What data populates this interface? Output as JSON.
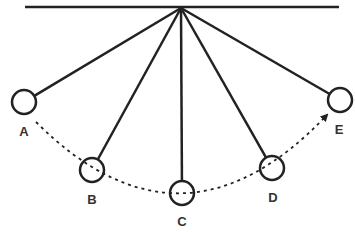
{
  "diagram": {
    "ceiling": {
      "x1": 25,
      "y1": 7,
      "x2": 339,
      "y2": 7
    },
    "pivot": {
      "x": 181,
      "y": 8
    },
    "bob_radius": 12,
    "bobs": [
      {
        "label": "A",
        "cx": 24,
        "cy": 102,
        "label_x": 24,
        "label_y": 136
      },
      {
        "label": "B",
        "cx": 92,
        "cy": 170,
        "label_x": 92,
        "label_y": 204
      },
      {
        "label": "C",
        "cx": 182,
        "cy": 193,
        "label_x": 182,
        "label_y": 226
      },
      {
        "label": "D",
        "cx": 272,
        "cy": 168,
        "label_x": 273,
        "label_y": 202
      },
      {
        "label": "E",
        "cx": 340,
        "cy": 100,
        "label_x": 339,
        "label_y": 134
      }
    ],
    "path": {
      "style": "dashed",
      "direction": "A to E",
      "arrow_at": "E"
    },
    "colors": {
      "stroke": "#222222",
      "background": "#ffffff"
    }
  }
}
